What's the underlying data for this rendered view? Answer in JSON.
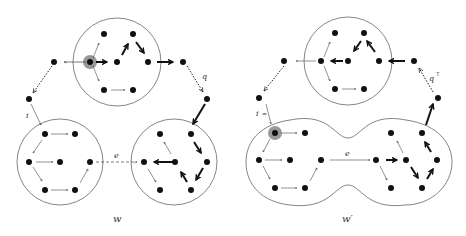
{
  "diagram": {
    "left": {
      "caption": "w",
      "labels": {
        "i": "i",
        "q": "q",
        "e": "e"
      }
    },
    "right": {
      "caption": "w′",
      "labels": {
        "i": "i",
        "i_mark": "≈",
        "q": "q",
        "q_sup": "⊤",
        "e": "e"
      }
    },
    "colors": {
      "node": "#111111",
      "outline": "#555555",
      "highlight": "#999999",
      "edge": "#222222"
    }
  }
}
